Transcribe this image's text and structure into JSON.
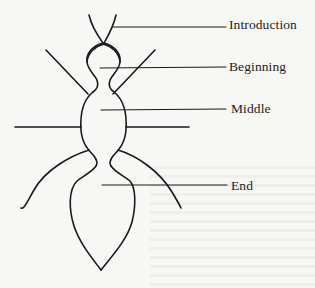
{
  "diagram": {
    "type": "insect-essay-structure",
    "stroke_color": "#1a1a1a",
    "labels": [
      {
        "id": "introduction",
        "text": "Introduction",
        "points_to": "antennae"
      },
      {
        "id": "beginning",
        "text": "Beginning",
        "points_to": "head"
      },
      {
        "id": "middle",
        "text": "Middle",
        "points_to": "thorax"
      },
      {
        "id": "end",
        "text": "End",
        "points_to": "abdomen"
      }
    ]
  }
}
